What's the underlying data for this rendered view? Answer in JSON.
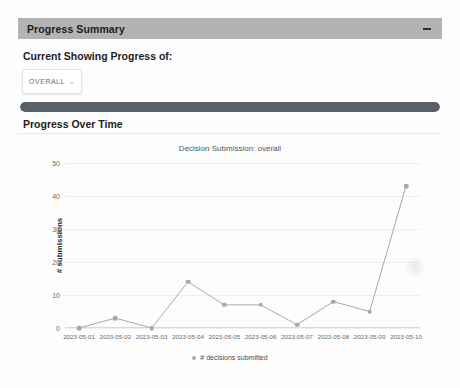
{
  "panel": {
    "title": "Progress Summary",
    "collapse_icon": "minus-icon"
  },
  "filter": {
    "label": "Current Showing Progress of:",
    "selected": "OVERALL",
    "chevron": "⌄",
    "options": [
      "OVERALL"
    ]
  },
  "progress": {
    "percent": 100,
    "fill_color": "#5a6067",
    "track_color": "#e6e6e6"
  },
  "section": {
    "heading": "Progress Over Time"
  },
  "watermark": "",
  "chart_data": {
    "type": "line",
    "title": "Decision Submission: overall",
    "xlabel": "",
    "ylabel": "# submissions",
    "categories": [
      "2023-05-01",
      "2023-05-02",
      "2023-05-03",
      "2023-05-04",
      "2023-05-05",
      "2023-05-06",
      "2023-05-07",
      "2023-05-08",
      "2023-05-09",
      "2023-05-10"
    ],
    "series": [
      {
        "name": "# decisions submitted",
        "values": [
          0,
          3,
          0,
          14,
          7,
          7,
          1,
          8,
          5,
          43
        ],
        "color": "#a8a8a8"
      }
    ],
    "ylim": [
      0,
      50
    ],
    "yticks": [
      0,
      10,
      20,
      30,
      40,
      50
    ],
    "grid": true,
    "legend": "bottom",
    "legend_entries": [
      "# decisions submitted"
    ]
  }
}
